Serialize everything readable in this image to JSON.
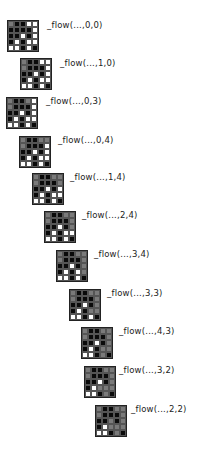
{
  "diagram": {
    "base_grid": [
      [
        "b",
        "b",
        "b",
        "w",
        "w"
      ],
      [
        "b",
        "b",
        "b",
        "b",
        "w"
      ],
      [
        "b",
        "b",
        "w",
        "b",
        "w"
      ],
      [
        "b",
        "w",
        "b",
        "w",
        "w"
      ],
      [
        "w",
        "w",
        "b",
        "w",
        "b"
      ]
    ],
    "mark_color": "#7a7a7a",
    "steps": [
      {
        "label": "_flow(...,0,0)",
        "mark": [
          0,
          0
        ],
        "grid_x": 7,
        "grid_y": 20,
        "label_x": 47,
        "label_y": 20
      },
      {
        "label": "_flow(...,1,0)",
        "mark": [
          1,
          0
        ],
        "grid_x": 20,
        "grid_y": 58,
        "label_x": 60,
        "label_y": 58
      },
      {
        "label": "_flow(...,0,3)",
        "mark": [
          0,
          3
        ],
        "grid_x": 6,
        "grid_y": 97,
        "label_x": 46,
        "label_y": 96
      },
      {
        "label": "_flow(...,0,4)",
        "mark": [
          0,
          4
        ],
        "grid_x": 19,
        "grid_y": 136,
        "label_x": 58,
        "label_y": 135
      },
      {
        "label": "_flow(...,1,4)",
        "mark": [
          1,
          4
        ],
        "grid_x": 32,
        "grid_y": 173,
        "label_x": 70,
        "label_y": 172
      },
      {
        "label": "_flow(...,2,4)",
        "mark": [
          2,
          4
        ],
        "grid_x": 44,
        "grid_y": 211,
        "label_x": 82,
        "label_y": 210
      },
      {
        "label": "_flow(...,3,4)",
        "mark": [
          3,
          4
        ],
        "grid_x": 56,
        "grid_y": 250,
        "label_x": 94,
        "label_y": 249
      },
      {
        "label": "_flow(...,3,3)",
        "mark": [
          3,
          3
        ],
        "grid_x": 69,
        "grid_y": 289,
        "label_x": 107,
        "label_y": 288
      },
      {
        "label": "_flow(...,4,3)",
        "mark": [
          4,
          3
        ],
        "grid_x": 81,
        "grid_y": 327,
        "label_x": 119,
        "label_y": 326
      },
      {
        "label": "_flow(...,3,2)",
        "mark": [
          3,
          2
        ],
        "grid_x": 84,
        "grid_y": 366,
        "label_x": 119,
        "label_y": 365
      },
      {
        "label": "_flow(...,2,2)",
        "mark": [
          2,
          2
        ],
        "grid_x": 95,
        "grid_y": 405,
        "label_x": 131,
        "label_y": 404
      }
    ]
  }
}
